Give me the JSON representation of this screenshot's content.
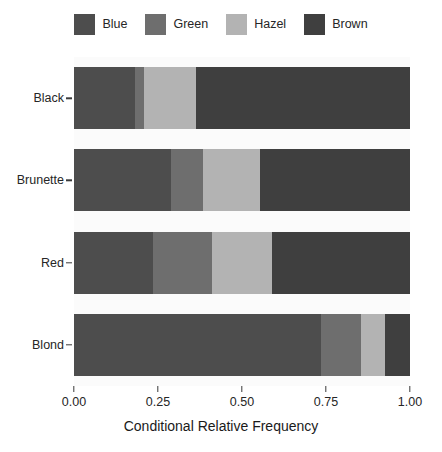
{
  "chart_data": {
    "type": "bar",
    "orientation": "horizontal",
    "stacked": true,
    "normalized": true,
    "title": "",
    "xlabel": "Conditional Relative Frequency",
    "ylabel": "",
    "xlim": [
      0,
      1
    ],
    "grid": false,
    "legend_position": "top",
    "categories": [
      "Black",
      "Brunette",
      "Red",
      "Blond"
    ],
    "category_order_top_to_bottom": [
      "Black",
      "Brunette",
      "Red",
      "Blond"
    ],
    "series": [
      {
        "name": "Blue",
        "color": "#4d4d4d",
        "values": [
          0.182,
          0.29,
          0.235,
          0.735
        ]
      },
      {
        "name": "Green",
        "color": "#6e6e6e",
        "values": [
          0.027,
          0.095,
          0.176,
          0.12
        ]
      },
      {
        "name": "Hazel",
        "color": "#b3b3b3",
        "values": [
          0.155,
          0.17,
          0.177,
          0.07
        ]
      },
      {
        "name": "Brown",
        "color": "#3f3f3f",
        "values": [
          0.636,
          0.445,
          0.412,
          0.075
        ]
      }
    ],
    "x_ticks": [
      0.0,
      0.25,
      0.5,
      0.75,
      1.0
    ],
    "x_tick_labels": [
      "0.00",
      "0.25",
      "0.50",
      "0.75",
      "1.00"
    ],
    "legend_entries": [
      {
        "label": "Blue",
        "color": "#4d4d4d"
      },
      {
        "label": "Green",
        "color": "#6e6e6e"
      },
      {
        "label": "Hazel",
        "color": "#b3b3b3"
      },
      {
        "label": "Brown",
        "color": "#3f3f3f"
      }
    ],
    "panel_background": "#fbfbfb",
    "figure_background": "#ffffff"
  }
}
